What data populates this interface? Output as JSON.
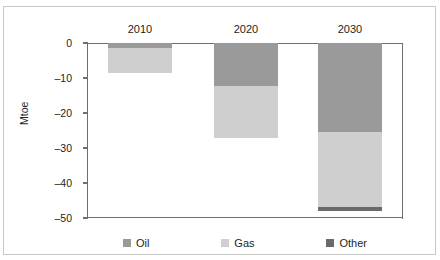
{
  "title": "",
  "axes": {
    "ylabel": "Mtoe",
    "yticks": [
      "0",
      "–10",
      "–20",
      "–30",
      "–40",
      "–50"
    ],
    "ytick_values": [
      0,
      -10,
      -20,
      -30,
      -40,
      -50
    ]
  },
  "legend": {
    "items": [
      {
        "label": "Oil",
        "color": "#9a9a9a"
      },
      {
        "label": "Gas",
        "color": "#cfcfcf"
      },
      {
        "label": "Other",
        "color": "#6a6a6a"
      }
    ]
  },
  "chart_data": {
    "type": "bar",
    "stacked": true,
    "orientation": "vertical",
    "title": "",
    "xlabel": "",
    "ylabel": "Mtoe",
    "ylim": [
      -50,
      0
    ],
    "ytick_step": 10,
    "grid": false,
    "legend_position": "bottom",
    "categories": [
      "2010",
      "2020",
      "2030"
    ],
    "series": [
      {
        "name": "Oil",
        "color": "#9a9a9a",
        "values": [
          -1.5,
          -12.3,
          -25.4
        ]
      },
      {
        "name": "Gas",
        "color": "#cfcfcf",
        "values": [
          -7.0,
          -14.8,
          -21.4
        ]
      },
      {
        "name": "Other",
        "color": "#6a6a6a",
        "values": [
          0,
          0,
          -1.2
        ]
      }
    ],
    "totals": [
      -8.5,
      -27.1,
      -48.0
    ]
  },
  "bars": [
    {
      "category": "2010",
      "left_px": 104,
      "width_px": 64,
      "segments": [
        {
          "name": "Oil",
          "height_px": 5,
          "color": "#9a9a9a"
        },
        {
          "name": "Gas",
          "height_px": 25,
          "color": "#cfcfcf"
        }
      ]
    },
    {
      "category": "2020",
      "left_px": 210,
      "width_px": 64,
      "segments": [
        {
          "name": "Oil",
          "height_px": 43,
          "color": "#9a9a9a"
        },
        {
          "name": "Gas",
          "height_px": 52,
          "color": "#cfcfcf"
        }
      ]
    },
    {
      "category": "2030",
      "left_px": 314,
      "width_px": 64,
      "segments": [
        {
          "name": "Oil",
          "height_px": 89,
          "color": "#9a9a9a"
        },
        {
          "name": "Gas",
          "height_px": 75,
          "color": "#cfcfcf"
        },
        {
          "name": "Other",
          "height_px": 4,
          "color": "#6a6a6a"
        }
      ]
    }
  ]
}
